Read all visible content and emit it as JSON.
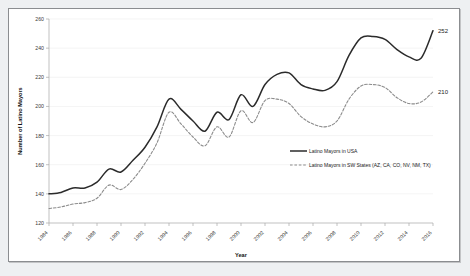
{
  "figure": {
    "background": "#ffffff",
    "border_color": "#8b8d90",
    "outside_background": "#eef0f2"
  },
  "chart_data": {
    "type": "line",
    "title": "",
    "xlabel": "Year",
    "ylabel": "Number of Latino Mayors",
    "xlim": [
      1984,
      2016
    ],
    "ylim": [
      120,
      260
    ],
    "ytick_step": 20,
    "xtick_step": 2,
    "grid": true,
    "grid_axis": "y",
    "legend_position": "center-right",
    "yticks": [
      120,
      140,
      160,
      180,
      200,
      220,
      240,
      260
    ],
    "xticks": [
      1984,
      1986,
      1988,
      1990,
      1992,
      1994,
      1996,
      1998,
      2000,
      2002,
      2004,
      2006,
      2008,
      2010,
      2012,
      2014,
      2016
    ],
    "x": [
      1984,
      1985,
      1986,
      1987,
      1988,
      1989,
      1990,
      1991,
      1992,
      1993,
      1994,
      1995,
      1996,
      1997,
      1998,
      1999,
      2000,
      2001,
      2002,
      2003,
      2004,
      2005,
      2006,
      2007,
      2008,
      2009,
      2010,
      2011,
      2012,
      2013,
      2014,
      2015,
      2016
    ],
    "series": [
      {
        "name": "Latino Mayors in USA",
        "style": "solid",
        "color": "#2b2b2b",
        "end_label": "252",
        "values": [
          140,
          141,
          144,
          144,
          148,
          157,
          155,
          163,
          172,
          186,
          205,
          198,
          190,
          183,
          196,
          191,
          208,
          200,
          215,
          222,
          223,
          215,
          212,
          211,
          217,
          235,
          247,
          248,
          246,
          239,
          234,
          233,
          252
        ]
      },
      {
        "name": "Latino Mayors in SW States (AZ, CA, CO, NV, NM, TX)",
        "style": "dashed",
        "color": "#8c8c8c",
        "end_label": "210",
        "values": [
          130,
          131,
          133,
          134,
          137,
          146,
          143,
          150,
          161,
          175,
          196,
          188,
          179,
          173,
          186,
          179,
          197,
          189,
          204,
          205,
          202,
          193,
          188,
          186,
          190,
          205,
          214,
          215,
          213,
          206,
          202,
          203,
          210
        ]
      }
    ],
    "annotations": [
      {
        "text": "252",
        "series": "Latino Mayors in USA",
        "x": 2016,
        "y": 252
      },
      {
        "text": "210",
        "series": "Latino Mayors in SW States (AZ, CA, CO, NV, NM, TX)",
        "x": 2016,
        "y": 210
      }
    ]
  }
}
